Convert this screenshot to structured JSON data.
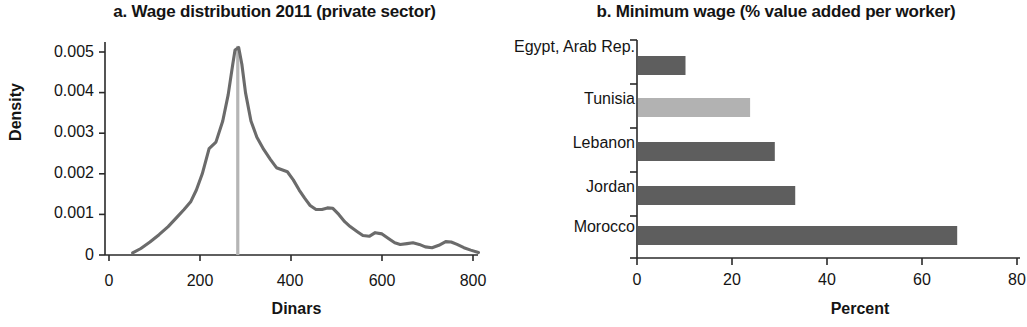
{
  "figure": {
    "panels": [
      {
        "key": "a",
        "title": "a. Wage distribution 2011 (private sector)",
        "xlabel": "Dinars",
        "ylabel": "Density"
      },
      {
        "key": "b",
        "title": "b. Minimum wage (% value added per worker)",
        "xlabel": "Percent",
        "ylabel": ""
      }
    ]
  },
  "chart_data": [
    {
      "type": "line",
      "title": "a. Wage distribution 2011 (private sector)",
      "xlabel": "Dinars",
      "ylabel": "Density",
      "xlim": [
        0,
        820
      ],
      "ylim": [
        0,
        0.0052
      ],
      "xticks": [
        0,
        200,
        400,
        600,
        800
      ],
      "xtick_labels": [
        "0",
        "200",
        "400",
        "600",
        "800"
      ],
      "yticks": [
        0,
        0.001,
        0.002,
        0.003,
        0.004,
        0.005
      ],
      "ytick_labels": [
        "0",
        "0.001",
        "0.002",
        "0.003",
        "0.004",
        "0.005"
      ],
      "grid": false,
      "legend": false,
      "line_color": "#6b6b6b",
      "annotations": [
        {
          "name": "minimum-wage-reference-line",
          "type": "vline",
          "x": 283,
          "color": "#b5b5b5"
        }
      ],
      "series": [
        {
          "name": "Density",
          "x": [
            52,
            70,
            90,
            110,
            130,
            150,
            165,
            180,
            192,
            205,
            220,
            235,
            250,
            262,
            272,
            277,
            285,
            292,
            300,
            312,
            325,
            340,
            355,
            368,
            380,
            392,
            405,
            418,
            430,
            442,
            455,
            468,
            480,
            492,
            505,
            518,
            530,
            545,
            558,
            572,
            585,
            600,
            615,
            628,
            640,
            655,
            668,
            682,
            695,
            710,
            725,
            740,
            752,
            765,
            780,
            795,
            812
          ],
          "y": [
            5e-05,
            0.00016,
            0.00032,
            0.0005,
            0.0007,
            0.00094,
            0.00112,
            0.00132,
            0.0016,
            0.002,
            0.00262,
            0.00278,
            0.0033,
            0.00395,
            0.0047,
            0.00505,
            0.00511,
            0.0047,
            0.004,
            0.0033,
            0.0029,
            0.0026,
            0.00235,
            0.00215,
            0.0021,
            0.00205,
            0.00185,
            0.0016,
            0.0014,
            0.00122,
            0.00112,
            0.00112,
            0.00116,
            0.00115,
            0.001,
            0.00082,
            0.0007,
            0.00058,
            0.00048,
            0.00046,
            0.00055,
            0.00052,
            0.0004,
            0.0003,
            0.00026,
            0.00028,
            0.0003,
            0.00026,
            0.0002,
            0.00018,
            0.00024,
            0.00033,
            0.00032,
            0.00026,
            0.00018,
            0.00012,
            6e-05
          ]
        }
      ]
    },
    {
      "type": "bar",
      "orientation": "horizontal",
      "title": "b. Minimum wage (% value added per worker)",
      "xlabel": "Percent",
      "ylabel": "",
      "xlim": [
        0,
        80
      ],
      "xticks": [
        0,
        20,
        40,
        60,
        80
      ],
      "xtick_labels": [
        "0",
        "20",
        "40",
        "60",
        "80"
      ],
      "grid": false,
      "legend": false,
      "categories": [
        "Egypt, Arab Rep.",
        "Tunisia",
        "Lebanon",
        "Jordan",
        "Morocco"
      ],
      "values": [
        10,
        23.6,
        28.8,
        33.1,
        67.2
      ],
      "bar_colors": [
        "#5e5e5e",
        "#b2b2b2",
        "#5e5e5e",
        "#5e5e5e",
        "#5e5e5e"
      ],
      "highlight_category": "Tunisia"
    }
  ]
}
